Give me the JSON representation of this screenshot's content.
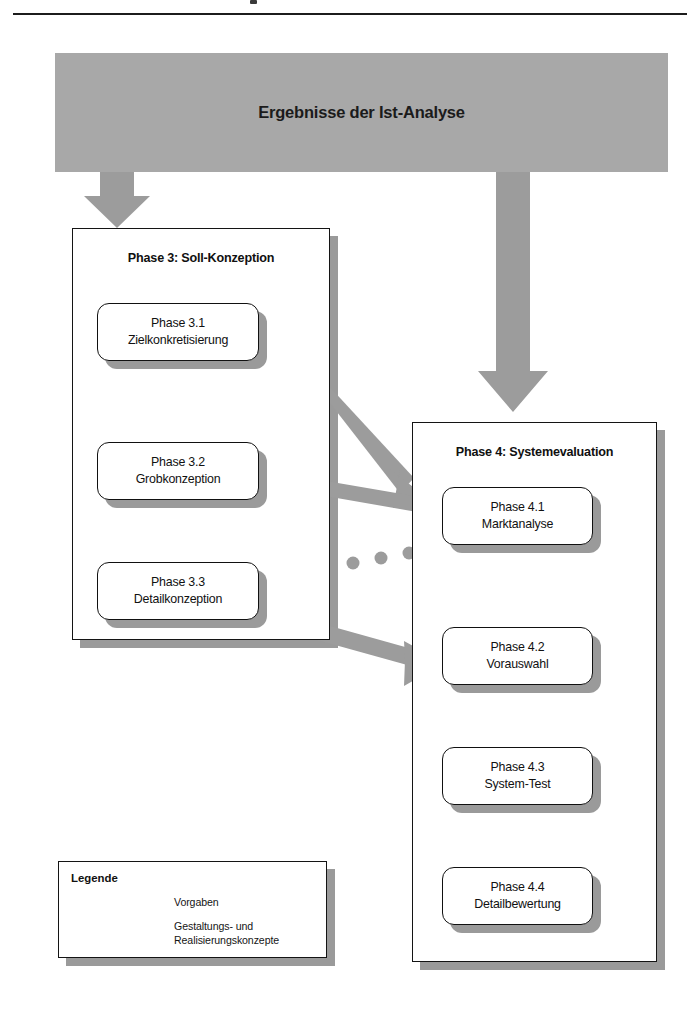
{
  "page": {
    "top_rule": true
  },
  "banner": {
    "label": "Ergebnisse der Ist-Analyse",
    "fill": "#a8a8a8"
  },
  "colors": {
    "arrow_gray": "#9c9c9c",
    "shadow_gray": "#9a9a9a",
    "outline_black": "#111111",
    "banner_gray": "#a8a8a8",
    "paper_white": "#ffffff"
  },
  "phase3": {
    "title": "Phase 3: Soll-Konzeption",
    "nodes": [
      {
        "id": "3.1",
        "line1": "Phase 3.1",
        "line2": "Zielkonkretisierung"
      },
      {
        "id": "3.2",
        "line1": "Phase 3.2",
        "line2": "Grobkonzeption"
      },
      {
        "id": "3.3",
        "line1": "Phase 3.3",
        "line2": "Detailkonzeption"
      }
    ]
  },
  "phase4": {
    "title": "Phase 4: Systemevaluation",
    "nodes": [
      {
        "id": "4.1",
        "line1": "Phase 4.1",
        "line2": "Marktanalyse"
      },
      {
        "id": "4.2",
        "line1": "Phase 4.2",
        "line2": "Vorauswahl"
      },
      {
        "id": "4.3",
        "line1": "Phase 4.3",
        "line2": "System-Test"
      },
      {
        "id": "4.4",
        "line1": "Phase 4.4",
        "line2": "Detailbewertung"
      }
    ]
  },
  "legend": {
    "title": "Legende",
    "entries": [
      {
        "marker": "solid-arrow-left",
        "label": "Vorgaben"
      },
      {
        "marker": "dotted-arrow-left",
        "label": "Gestaltungs- und\nRealisierungskonzepte"
      }
    ],
    "entry2_line1": "Gestaltungs- und",
    "entry2_line2": "Realisierungskonzepte"
  },
  "connectors": {
    "banner_to_phase3": "down-arrow",
    "banner_to_phase4": "down-arrow",
    "p31_to_p41": "diagonal-arrow",
    "p32_to_p41": "diagonal-arrow",
    "p33_to_p42": "diagonal-arrow",
    "p41_to_p33": "dotted-arrow-left",
    "internal_flow": "dotted-down-arrow"
  }
}
